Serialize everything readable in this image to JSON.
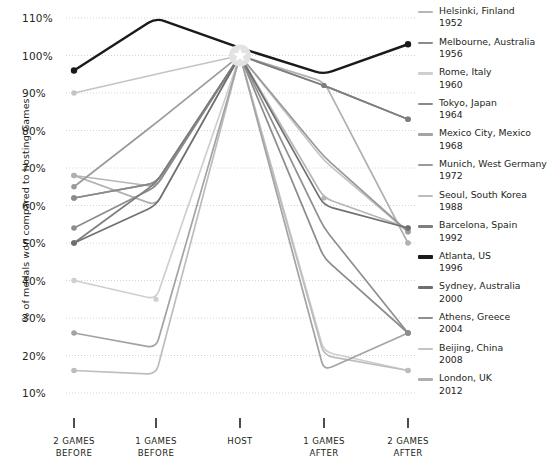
{
  "chart": {
    "ylabel": "% of medals won compared to hosting Games",
    "xlabel": "",
    "title": ""
  },
  "axis": {
    "y_ticks": [
      "110%",
      "100%",
      "90%",
      "80%",
      "70%",
      "60%",
      "50%",
      "40%",
      "30%",
      "20%",
      "10%"
    ],
    "x_ticks": [
      {
        "line1": "2 GAMES",
        "line2": "BEFORE"
      },
      {
        "line1": "1 GAMES",
        "line2": "BEFORE"
      },
      {
        "line1": "HOST",
        "line2": ""
      },
      {
        "line1": "1 GAMES",
        "line2": "AFTER"
      },
      {
        "line1": "2 GAMES",
        "line2": "AFTER"
      }
    ]
  },
  "legend": {
    "items": [
      {
        "city": "Helsinki, Finland",
        "year": "1952",
        "color": "#b6b6b6"
      },
      {
        "city": "Melbourne, Australia",
        "year": "1956",
        "color": "#8c8c8c"
      },
      {
        "city": "Rome, Italy",
        "year": "1960",
        "color": "#cfcfcf"
      },
      {
        "city": "Tokyo, Japan",
        "year": "1964",
        "color": "#8a8a8a"
      },
      {
        "city": "Mexico City, Mexico",
        "year": "1968",
        "color": "#a3a3a3"
      },
      {
        "city": "Munich, West Germany",
        "year": "1972",
        "color": "#9a9a9a"
      },
      {
        "city": "Seoul, South Korea",
        "year": "1988",
        "color": "#bdbdbd"
      },
      {
        "city": "Barcelona, Spain",
        "year": "1992",
        "color": "#7e7e7e"
      },
      {
        "city": "Atlanta, US",
        "year": "1996",
        "color": "#1a1a1a"
      },
      {
        "city": "Sydney, Australia",
        "year": "2000",
        "color": "#6f6f6f"
      },
      {
        "city": "Athens, Greece",
        "year": "2004",
        "color": "#8f8f8f"
      },
      {
        "city": "Beijing, China",
        "year": "2008",
        "color": "#c4c4c4"
      },
      {
        "city": "London, UK",
        "year": "2012",
        "color": "#b0b0b0"
      }
    ]
  },
  "chart_data": {
    "type": "line",
    "title": "",
    "xlabel": "",
    "ylabel": "% of medals won compared to hosting Games",
    "categories": [
      "2 GAMES BEFORE",
      "1 GAMES BEFORE",
      "HOST",
      "1 GAMES AFTER",
      "2 GAMES AFTER"
    ],
    "ylim": [
      5,
      114
    ],
    "yticks": [
      10,
      20,
      30,
      40,
      50,
      60,
      70,
      80,
      90,
      100,
      110
    ],
    "grid": "horizontal-dotted",
    "legend_position": "right",
    "host_marker": "star",
    "series": [
      {
        "name": "Helsinki, Finland 1952",
        "year": 1952,
        "color": "#b6b6b6",
        "values": [
          68,
          65,
          100,
          62,
          54
        ]
      },
      {
        "name": "Melbourne, Australia 1956",
        "year": 1956,
        "color": "#8c8c8c",
        "values": [
          54,
          65,
          100,
          46,
          26
        ]
      },
      {
        "name": "Rome, Italy 1960",
        "year": 1960,
        "color": "#cfcfcf",
        "values": [
          40,
          35,
          100,
          21,
          16
        ]
      },
      {
        "name": "Tokyo, Japan 1964",
        "year": 1964,
        "color": "#8a8a8a",
        "values": [
          62,
          66,
          100,
          92,
          83
        ]
      },
      {
        "name": "Mexico City, Mexico 1968",
        "year": 1968,
        "color": "#a3a3a3",
        "values": [
          26,
          22,
          100,
          16,
          26
        ]
      },
      {
        "name": "Munich, West Germany 1972",
        "year": 1972,
        "color": "#9a9a9a",
        "values": [
          65,
          82,
          100,
          73,
          53
        ]
      },
      {
        "name": "Seoul, South Korea 1988",
        "year": 1988,
        "color": "#bdbdbd",
        "values": [
          16,
          15,
          100,
          20,
          16
        ]
      },
      {
        "name": "Barcelona, Spain 1992",
        "year": 1992,
        "color": "#7e7e7e",
        "values": [
          50,
          66,
          100,
          92,
          83
        ]
      },
      {
        "name": "Atlanta, US 1996",
        "year": 1996,
        "color": "#1a1a1a",
        "values": [
          96,
          110,
          102,
          95,
          103
        ]
      },
      {
        "name": "Sydney, Australia 2000",
        "year": 2000,
        "color": "#6f6f6f",
        "values": [
          50,
          60,
          100,
          60,
          54
        ]
      },
      {
        "name": "Athens, Greece 2004",
        "year": 2004,
        "color": "#8f8f8f",
        "values": [
          62,
          66,
          100,
          54,
          26
        ]
      },
      {
        "name": "Beijing, China 2008",
        "year": 2008,
        "color": "#c4c4c4",
        "values": [
          90,
          95,
          100,
          72,
          53
        ]
      },
      {
        "name": "London, UK 2012",
        "year": 2012,
        "color": "#b0b0b0",
        "values": [
          68,
          60,
          100,
          93,
          50
        ]
      }
    ]
  }
}
